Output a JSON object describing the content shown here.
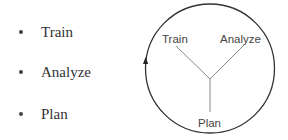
{
  "bullets": {
    "items": [
      {
        "label": "Train"
      },
      {
        "label": "Analyze"
      },
      {
        "label": "Plan"
      }
    ]
  },
  "cycle_diagram": {
    "labels": {
      "top_left": "Train",
      "top_right": "Analyze",
      "bottom": "Plan"
    },
    "arrow_direction": "clockwise",
    "colors": {
      "stroke": "#333333",
      "spoke": "#888888",
      "text": "#444444"
    }
  }
}
